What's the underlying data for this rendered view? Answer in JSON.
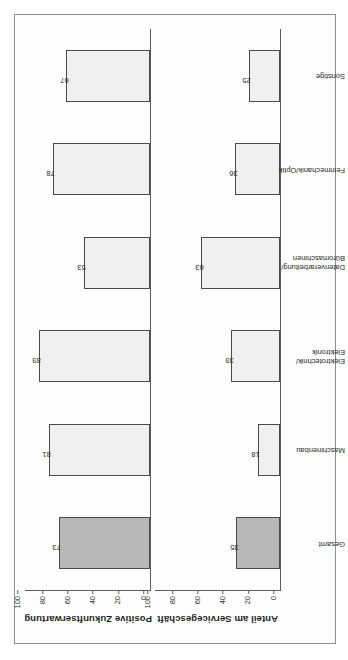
{
  "document": {
    "language": "de",
    "orientation_note": "rotated-90-ccw"
  },
  "caption": {
    "text": "Das Geschäft mit Serviceträgern entwickelt sich weiterhin positiv. Bei 73 Prozent der Unternehmen, die Serviceerträge anbieten, ist der Abschluß wachsend. Insbesondere Branchen mit noch niedrigem Anteil am gesamten Servicegeschäft erwarten einen Aufwärtstrend (Maschinenbau, Elektrotechnik/Elektronik)."
  },
  "chart_data": [
    {
      "id": "positive-zukunftserwartung",
      "type": "bar",
      "title": "Positive Zukunftserwartung",
      "ylabel": "Positive Zukunftserwartung",
      "xlabel": "",
      "ylim": [
        0,
        100
      ],
      "yticks": [
        0,
        20,
        40,
        60,
        80,
        100
      ],
      "ytick_labels": [
        "0",
        "20",
        "40",
        "60",
        "80",
        "100"
      ],
      "grid": false,
      "legend": "none",
      "categories": [
        "Gesamt",
        "Maschinenbau",
        "Elektrotechnik/\nElektronik",
        "Datenverarbeitung/\nBüromaschinen",
        "Feinmechanik/Optik",
        "Sonstige"
      ],
      "values": [
        73,
        81,
        89,
        53,
        78,
        67
      ],
      "value_labels": [
        "73",
        "81",
        "89",
        "53",
        "78",
        "67"
      ],
      "highlight_index": 0,
      "colors": {
        "bar_fill": "#f0f0ef",
        "bar_fill_highlight": "#b8b8b6",
        "bar_edge": "#4a4a4a",
        "axis": "#5d5d5d",
        "text": "#2b2b2b"
      }
    },
    {
      "id": "anteil-am-servicegeschaeft",
      "type": "bar",
      "title": "Anteil am Servicegeschäft",
      "ylabel": "Anteil am Servicegeschäft",
      "xlabel": "",
      "ylim": [
        0,
        100
      ],
      "yticks": [
        0,
        20,
        40,
        60,
        80,
        100
      ],
      "ytick_labels": [
        "0",
        "20",
        "40",
        "60",
        "80",
        "100"
      ],
      "grid": false,
      "legend": "none",
      "categories": [
        "Gesamt",
        "Maschinenbau",
        "Elektrotechnik/\nElektronik",
        "Datenverarbeitung/\nBüromaschinen",
        "Feinmechanik/Optik",
        "Sonstige"
      ],
      "values": [
        35,
        18,
        39,
        63,
        36,
        25
      ],
      "value_labels": [
        "35",
        "18",
        "39",
        "63",
        "36",
        "25"
      ],
      "highlight_index": 0,
      "colors": {
        "bar_fill": "#f0f0ef",
        "bar_fill_highlight": "#b8b8b6",
        "bar_edge": "#4a4a4a",
        "axis": "#5d5d5d",
        "text": "#2b2b2b"
      }
    }
  ]
}
